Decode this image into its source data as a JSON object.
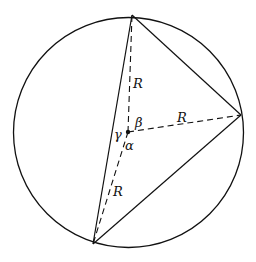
{
  "diagram": {
    "circle": {
      "cx": 128.5,
      "cy": 132.5,
      "r": 115
    },
    "center": {
      "x": 128,
      "y": 132
    },
    "vertices": [
      {
        "id": "top",
        "x": 132,
        "y": 15
      },
      {
        "id": "right",
        "x": 241,
        "y": 115
      },
      {
        "id": "bottom",
        "x": 93,
        "y": 244
      }
    ],
    "labels": {
      "radius_top": "R",
      "radius_right": "R",
      "radius_bottom": "R",
      "angle_alpha": "α",
      "angle_beta": "β",
      "angle_gamma": "γ"
    },
    "colors": {
      "stroke": "#111111",
      "background": "#ffffff"
    }
  }
}
